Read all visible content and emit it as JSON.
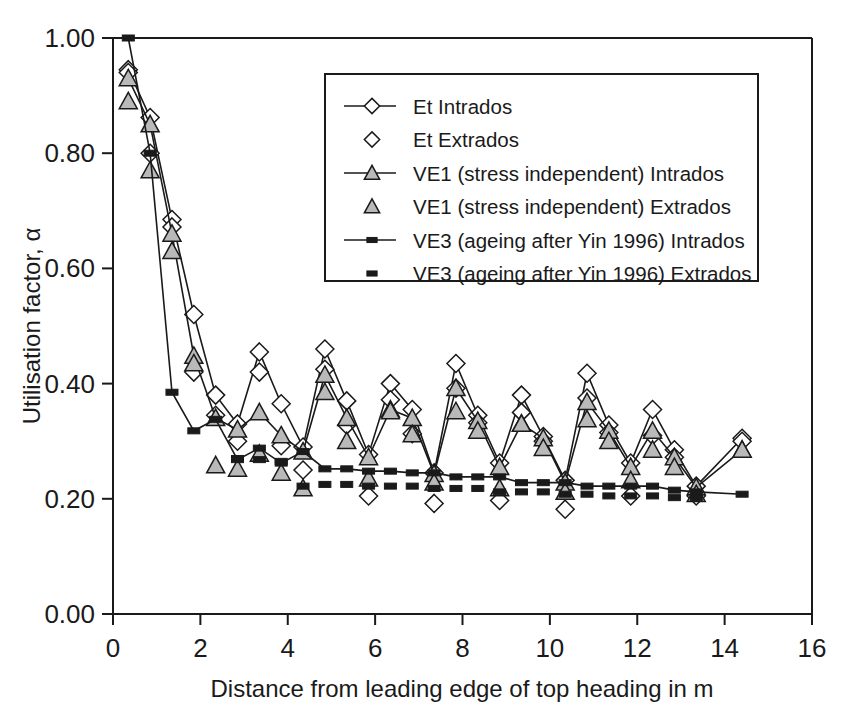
{
  "chart_data": {
    "type": "line",
    "title": "",
    "xlabel": "Distance from leading edge of top heading in m",
    "ylabel": "Utilisation factor, α",
    "xlim": [
      0,
      16
    ],
    "ylim": [
      0,
      1.0
    ],
    "xticks": [
      "0",
      "2",
      "4",
      "6",
      "8",
      "10",
      "12",
      "14",
      "16"
    ],
    "yticks": [
      "0.00",
      "0.20",
      "0.40",
      "0.60",
      "0.80",
      "1.00"
    ],
    "grid": false,
    "legend_position": "top-center",
    "series": [
      {
        "name": "Et Intrados",
        "marker": "open-diamond",
        "line": true,
        "x": [
          0.35,
          0.85,
          1.35,
          1.85,
          2.35,
          2.85,
          3.35,
          3.85,
          4.35,
          4.85,
          5.35,
          5.85,
          6.35,
          6.85,
          7.35,
          7.85,
          8.35,
          8.85,
          9.35,
          9.85,
          10.35,
          10.85,
          11.35,
          11.85,
          12.35,
          12.85,
          13.35,
          14.4
        ],
        "y": [
          0.945,
          0.862,
          0.685,
          0.52,
          0.38,
          0.33,
          0.455,
          0.365,
          0.29,
          0.46,
          0.37,
          0.277,
          0.4,
          0.355,
          0.245,
          0.435,
          0.345,
          0.262,
          0.38,
          0.308,
          0.232,
          0.418,
          0.328,
          0.262,
          0.355,
          0.285,
          0.222,
          0.305
        ]
      },
      {
        "name": "Et Extrados",
        "marker": "open-diamond",
        "line": false,
        "x": [
          0.35,
          0.85,
          1.35,
          1.85,
          2.35,
          2.85,
          3.35,
          3.85,
          4.35,
          4.85,
          5.35,
          5.85,
          6.35,
          6.85,
          7.35,
          7.85,
          8.35,
          8.85,
          9.35,
          9.85,
          10.35,
          10.85,
          11.35,
          11.85,
          12.35,
          12.85,
          13.35,
          14.4
        ],
        "y": [
          0.94,
          0.8,
          0.672,
          0.42,
          0.345,
          0.3,
          0.42,
          0.292,
          0.25,
          0.425,
          0.328,
          0.205,
          0.372,
          0.313,
          0.192,
          0.392,
          0.332,
          0.197,
          0.35,
          0.3,
          0.182,
          0.375,
          0.315,
          0.205,
          0.31,
          0.272,
          0.205,
          0.3
        ]
      },
      {
        "name": "VE1 (stress independent) Intrados",
        "marker": "filled-triangle",
        "line": true,
        "x": [
          0.35,
          0.85,
          1.35,
          1.85,
          2.35,
          2.85,
          3.35,
          3.85,
          4.35,
          4.85,
          5.35,
          5.85,
          6.35,
          6.85,
          7.35,
          7.85,
          8.35,
          8.85,
          9.35,
          9.85,
          10.35,
          10.85,
          11.35,
          11.85,
          12.35,
          12.85,
          13.35,
          14.4
        ],
        "y": [
          0.93,
          0.85,
          0.66,
          0.448,
          0.34,
          0.32,
          0.35,
          0.31,
          0.282,
          0.415,
          0.34,
          0.272,
          0.355,
          0.34,
          0.243,
          0.392,
          0.335,
          0.255,
          0.33,
          0.305,
          0.228,
          0.368,
          0.318,
          0.255,
          0.318,
          0.272,
          0.22,
          0.285
        ]
      },
      {
        "name": "VE1 (stress independent) Extrados",
        "marker": "filled-triangle",
        "line": false,
        "x": [
          0.35,
          0.85,
          1.35,
          1.85,
          2.35,
          2.85,
          3.35,
          3.85,
          4.35,
          4.85,
          5.35,
          5.85,
          6.35,
          6.85,
          7.35,
          7.85,
          8.35,
          8.85,
          9.35,
          9.85,
          10.35,
          10.85,
          11.35,
          11.85,
          12.35,
          12.85,
          13.35,
          14.4
        ],
        "y": [
          0.89,
          0.77,
          0.63,
          0.435,
          0.258,
          0.252,
          0.278,
          0.245,
          0.218,
          0.385,
          0.3,
          0.235,
          0.352,
          0.312,
          0.228,
          0.352,
          0.318,
          0.218,
          0.33,
          0.288,
          0.212,
          0.338,
          0.3,
          0.232,
          0.285,
          0.255,
          0.208,
          0.285
        ]
      },
      {
        "name": "VE3 (ageing after Yin 1996) Intrados",
        "marker": "filled-square",
        "line": true,
        "x": [
          0.35,
          0.85,
          1.35,
          1.85,
          2.35,
          2.85,
          3.35,
          3.85,
          4.35,
          4.85,
          5.35,
          5.85,
          6.35,
          6.85,
          7.35,
          7.85,
          8.35,
          8.85,
          9.35,
          9.85,
          10.35,
          10.85,
          11.35,
          11.85,
          12.35,
          12.85,
          13.35,
          14.4
        ],
        "y": [
          1.0,
          0.8,
          0.385,
          0.318,
          0.338,
          0.268,
          0.288,
          0.262,
          0.282,
          0.252,
          0.252,
          0.248,
          0.248,
          0.245,
          0.245,
          0.238,
          0.238,
          0.238,
          0.228,
          0.228,
          0.228,
          0.222,
          0.222,
          0.222,
          0.222,
          0.215,
          0.212,
          0.208
        ]
      },
      {
        "name": "VE3 (ageing after Yin 1996) Extrados",
        "marker": "filled-square",
        "line": false,
        "x": [
          2.85,
          3.35,
          3.85,
          4.35,
          4.85,
          5.35,
          5.85,
          6.35,
          6.85,
          7.35,
          7.85,
          8.35,
          8.85,
          9.35,
          9.85,
          10.35,
          10.85,
          11.35,
          11.85,
          12.35,
          12.85,
          13.35
        ],
        "y": [
          0.27,
          0.268,
          0.265,
          0.222,
          0.225,
          0.225,
          0.222,
          0.222,
          0.222,
          0.218,
          0.218,
          0.218,
          0.212,
          0.212,
          0.212,
          0.208,
          0.208,
          0.205,
          0.205,
          0.205,
          0.202,
          0.202
        ]
      }
    ],
    "legend": [
      {
        "label": "Et Intrados",
        "marker": "open-diamond",
        "line": true
      },
      {
        "label": "Et Extrados",
        "marker": "open-diamond",
        "line": false
      },
      {
        "label": "VE1 (stress independent) Intrados",
        "marker": "filled-triangle",
        "line": true
      },
      {
        "label": "VE1 (stress independent) Extrados",
        "marker": "filled-triangle",
        "line": false
      },
      {
        "label": "VE3 (ageing after Yin 1996) Intrados",
        "marker": "filled-square",
        "line": true
      },
      {
        "label": "VE3 (ageing after Yin 1996) Extrados",
        "marker": "filled-square",
        "line": false
      }
    ],
    "colors": {
      "ink": "#1a1a1a",
      "background": "#ffffff",
      "triangle_fill": "#b9b9b9",
      "marker_fill": "#ffffff"
    }
  }
}
